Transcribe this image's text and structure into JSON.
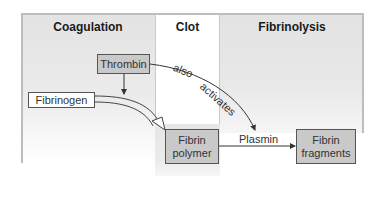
{
  "diagram": {
    "panels": [
      {
        "id": "coagulation",
        "title": "Coagulation"
      },
      {
        "id": "clot",
        "title": "Clot"
      },
      {
        "id": "fibrinolysis",
        "title": "Fibrinolysis"
      }
    ],
    "nodes": {
      "thrombin": "Thrombin",
      "fibrinogen": "Fibrinogen",
      "fibrin_polymer_line1": "Fibrin",
      "fibrin_polymer_line2": "polymer",
      "plasmin": "Plasmin",
      "fibrin_fragments_line1": "Fibrin",
      "fibrin_fragments_line2": "fragments"
    },
    "edge_labels": {
      "also": "also",
      "activates": "activates"
    },
    "edges": [
      {
        "from": "Thrombin",
        "to": "Fibrinogen-to-Fibrin conversion",
        "style": "thin arrow"
      },
      {
        "from": "Fibrinogen",
        "to": "Fibrin polymer",
        "style": "hollow double-line arrow"
      },
      {
        "from": "Thrombin",
        "to": "Plasmin",
        "label": "also activates",
        "style": "curved thin arrow"
      },
      {
        "from": "Fibrin polymer",
        "to": "Fibrin fragments",
        "via": "Plasmin",
        "style": "thin arrow"
      }
    ],
    "colors": {
      "panel_gray": "#e3e3e3",
      "box_shaded": "#c9c9c9",
      "box_border": "#555555",
      "border": "#bdbdbd"
    }
  }
}
